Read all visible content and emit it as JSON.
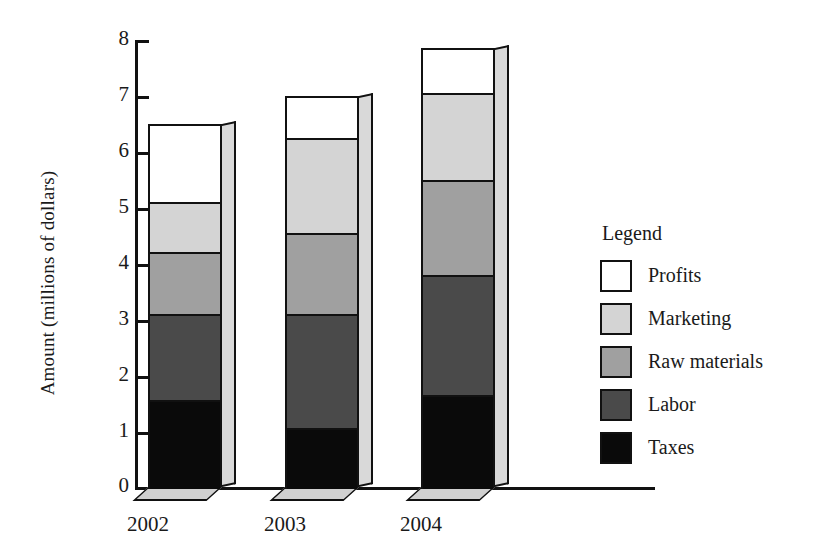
{
  "chart_data": {
    "type": "bar",
    "subtype": "stacked-bar-3d",
    "title": "",
    "xlabel": "",
    "ylabel": "Amount (millions of dollars)",
    "categories": [
      "2002",
      "2003",
      "2004"
    ],
    "ylim": [
      0,
      8
    ],
    "yticks": [
      "0",
      "1",
      "2",
      "3",
      "4",
      "5",
      "6",
      "7",
      "8"
    ],
    "grid": false,
    "legend": {
      "title": "Legend",
      "position": "right",
      "entries": [
        {
          "name": "Profits",
          "color": "#ffffff"
        },
        {
          "name": "Marketing",
          "color": "#d4d4d4"
        },
        {
          "name": "Raw materials",
          "color": "#a0a0a0"
        },
        {
          "name": "Labor",
          "color": "#4a4a4a"
        },
        {
          "name": "Taxes",
          "color": "#0a0a0a"
        }
      ]
    },
    "stack_order_bottom_to_top": [
      "Taxes",
      "Labor",
      "Raw materials",
      "Marketing",
      "Profits"
    ],
    "series": [
      {
        "name": "Taxes",
        "color": "#0a0a0a",
        "values": [
          1.55,
          1.05,
          1.65
        ]
      },
      {
        "name": "Labor",
        "color": "#4a4a4a",
        "values": [
          1.55,
          2.05,
          2.15
        ]
      },
      {
        "name": "Raw materials",
        "color": "#a0a0a0",
        "values": [
          1.1,
          1.45,
          1.7
        ]
      },
      {
        "name": "Marketing",
        "color": "#d4d4d4",
        "values": [
          0.9,
          1.7,
          1.55
        ]
      },
      {
        "name": "Profits",
        "color": "#ffffff",
        "values": [
          1.4,
          0.75,
          0.8
        ]
      }
    ],
    "cumulative_tops": {
      "2002": {
        "Taxes": 1.55,
        "Labor": 3.1,
        "Raw materials": 4.2,
        "Marketing": 5.1,
        "Profits": 6.5
      },
      "2003": {
        "Taxes": 1.05,
        "Labor": 3.1,
        "Raw materials": 4.55,
        "Marketing": 6.25,
        "Profits": 7.0
      },
      "2004": {
        "Taxes": 1.65,
        "Labor": 3.8,
        "Raw materials": 5.5,
        "Marketing": 7.05,
        "Profits": 7.85
      }
    },
    "totals": [
      6.5,
      7.0,
      7.85
    ]
  }
}
